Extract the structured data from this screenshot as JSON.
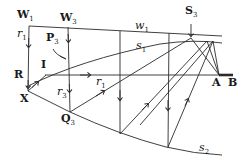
{
  "diagram": {
    "type": "ray-path diagram",
    "colors": {
      "stroke": "#2a2a2a",
      "text": "#1a1a1a",
      "background": "#ffffff"
    },
    "labels": {
      "W1": {
        "main": "W",
        "sub": "1"
      },
      "W3": {
        "main": "W",
        "sub": "3"
      },
      "S3": {
        "main": "S",
        "sub": "3"
      },
      "P3": {
        "main": "P",
        "sub": "3"
      },
      "Q3": {
        "main": "Q",
        "sub": "3"
      },
      "R": {
        "main": "R"
      },
      "I": {
        "main": "I"
      },
      "X": {
        "main": "X"
      },
      "A": {
        "main": "A"
      },
      "B": {
        "main": "B"
      },
      "r1_left": {
        "main": "r",
        "sub": "1"
      },
      "r1_mid": {
        "main": "r",
        "sub": "1"
      },
      "r3": {
        "main": "r",
        "sub": "3"
      },
      "w1": {
        "main": "w",
        "sub": "1"
      },
      "s1": {
        "main": "s",
        "sub": "1"
      },
      "s2": {
        "main": "s",
        "sub": "2"
      }
    },
    "curves": [
      "w1",
      "s1",
      "s2"
    ],
    "rays": [
      "r1",
      "r3"
    ]
  }
}
